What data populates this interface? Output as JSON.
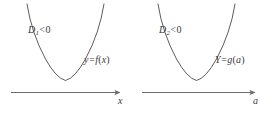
{
  "figure": {
    "kind": "math-diagram",
    "background_color": "#ffffff",
    "curve_color": "#4a4a4a",
    "axis_color": "#6a6a6a",
    "text_color": "#3a3a3a"
  },
  "panels": [
    {
      "id": "left",
      "discriminant": {
        "symbol": "D",
        "subscript": "1",
        "operator": "<",
        "value": "0",
        "text": "D1 < 0"
      },
      "function": {
        "output": "y",
        "equals": "=",
        "name": "f",
        "argument": "x",
        "text": "y = f(x)"
      },
      "axis": {
        "label": "x",
        "arrow": "right-arrow-icon"
      },
      "curve": {
        "shape": "parabola",
        "opens": "up",
        "vertex_above_axis": true,
        "real_roots": 0
      }
    },
    {
      "id": "right",
      "discriminant": {
        "symbol": "D",
        "subscript": "2",
        "operator": "<",
        "value": "0",
        "text": "D2 < 0"
      },
      "function": {
        "output": "Y",
        "equals": "=",
        "name": "g",
        "argument": "a",
        "text": "Y = g(a)"
      },
      "axis": {
        "label": "a",
        "arrow": "right-arrow-icon"
      },
      "curve": {
        "shape": "parabola",
        "opens": "up",
        "vertex_above_axis": true,
        "real_roots": 0
      }
    }
  ]
}
